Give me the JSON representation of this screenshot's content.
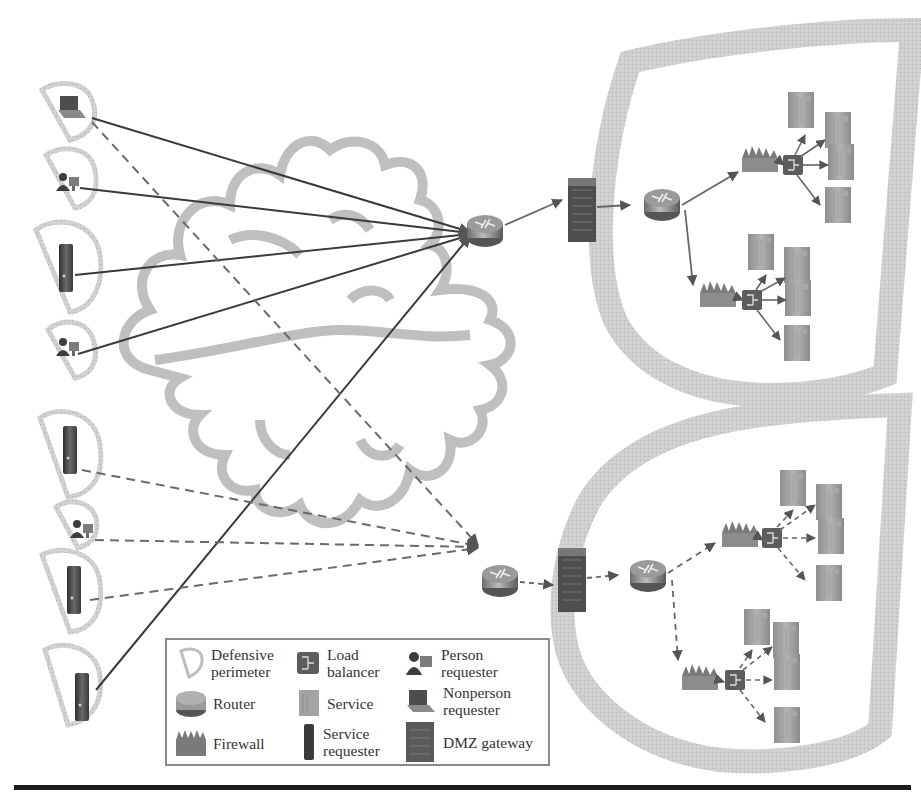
{
  "diagram": {
    "type": "network security architecture",
    "colors": {
      "perimeter": "#c8c8c8",
      "cloud": "#bdbdbd",
      "solid_line": "#3a3a3a",
      "dashed_line": "#6a6a6a",
      "device_dark": "#4a4a4a",
      "rule": "#1c1c1c"
    },
    "left_requesters": [
      {
        "kind": "nonperson-requester",
        "icon": "laptop-icon",
        "link": "solid+dashed"
      },
      {
        "kind": "person-requester",
        "icon": "person-at-computer-icon",
        "link": "solid"
      },
      {
        "kind": "service-requester",
        "icon": "tower-server-icon",
        "link": "solid"
      },
      {
        "kind": "person-requester",
        "icon": "person-at-computer-icon",
        "link": "solid"
      },
      {
        "kind": "service-requester",
        "icon": "tower-server-icon",
        "link": "dashed"
      },
      {
        "kind": "person-requester",
        "icon": "person-at-computer-icon",
        "link": "dashed"
      },
      {
        "kind": "service-requester",
        "icon": "tower-server-icon",
        "link": "dashed"
      },
      {
        "kind": "service-requester",
        "icon": "tower-server-icon",
        "link": "solid"
      }
    ],
    "zones": [
      {
        "name": "upper-zone",
        "link_style": "solid",
        "services_per_cluster": 4,
        "clusters": 2
      },
      {
        "name": "lower-zone",
        "link_style": "dashed",
        "services_per_cluster": 4,
        "clusters": 2
      }
    ]
  },
  "legend": {
    "items": [
      {
        "icon": "defensive-perimeter-icon",
        "label": "Defensive\nperimeter"
      },
      {
        "icon": "load-balancer-icon",
        "label": "Load\nbalancer"
      },
      {
        "icon": "person-requester-icon",
        "label": "Person\nrequester"
      },
      {
        "icon": "router-icon",
        "label": "Router"
      },
      {
        "icon": "service-icon",
        "label": "Service"
      },
      {
        "icon": "nonperson-requester-icon",
        "label": "Nonperson\nrequester"
      },
      {
        "icon": "firewall-icon",
        "label": "Firewall"
      },
      {
        "icon": "service-requester-icon",
        "label": "Service\nrequester"
      },
      {
        "icon": "dmz-gateway-icon",
        "label": "DMZ gateway"
      }
    ]
  }
}
